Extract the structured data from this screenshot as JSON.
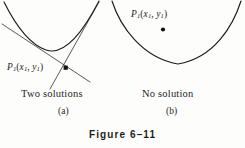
{
  "figure": {
    "number_label": "Figure 6–11",
    "background_color": "#fdfdfc",
    "ink_color": "#1a1a1a",
    "width": 245,
    "height": 148
  },
  "panels": [
    {
      "tag": "(a)",
      "caption": "Two solutions",
      "point_label": {
        "base": "P",
        "base_sub": "1",
        "open_paren": "(",
        "x_var": "x",
        "x_sub": "1",
        "comma": ", ",
        "y_var": "y",
        "y_sub": "1",
        "close_paren": ")"
      },
      "point_position": {
        "x": 66,
        "y": 68
      },
      "curve": {
        "type": "parabola",
        "vertex": {
          "x": 46,
          "y": 50
        },
        "opens": "up",
        "x_from": 4,
        "x_to": 98
      },
      "tangent_lines": [
        {
          "from": {
            "x": 2,
            "y": 24
          },
          "to": {
            "x": 90,
            "y": 82
          }
        },
        {
          "from": {
            "x": 50,
            "y": 89
          },
          "to": {
            "x": 99,
            "y": 2
          }
        }
      ]
    },
    {
      "tag": "(b)",
      "caption": "No solution",
      "point_label": {
        "base": "P",
        "base_sub": "1",
        "open_paren": "(",
        "x_var": "x",
        "x_sub": "1",
        "comma": ", ",
        "y_var": "y",
        "y_sub": "1",
        "close_paren": ")"
      },
      "point_position": {
        "x": 163,
        "y": 29
      },
      "curve": {
        "type": "parabola",
        "vertex": {
          "x": 178,
          "y": 64
        },
        "opens": "up",
        "x_from": 112,
        "x_to": 240
      },
      "tangent_lines": []
    }
  ]
}
